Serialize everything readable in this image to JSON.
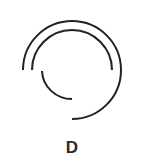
{
  "figure": {
    "center": [
      72,
      70
    ],
    "stroke_color": "#222222",
    "stroke_width": 2,
    "arcs": [
      {
        "name": "outer-arc",
        "radius": 49,
        "start_deg": 180,
        "end_deg": 450,
        "description": "from left, clockwise over top and right, ending at bottom"
      },
      {
        "name": "middle-arc",
        "radius": 40,
        "start_deg": 180,
        "end_deg": 360,
        "description": "top semicircle from left to right"
      },
      {
        "name": "inner-arc",
        "radius": 30,
        "start_deg": 180,
        "end_deg": 90,
        "description": "bottom-left quarter from left to bottom"
      }
    ]
  },
  "label": "D"
}
